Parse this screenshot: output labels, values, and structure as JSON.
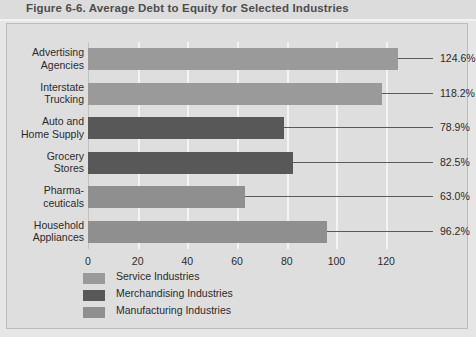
{
  "figure": {
    "title": "Figure 6-6. Average Debt to Equity for Selected Industries"
  },
  "colors": {
    "service": "#9a9a9a",
    "merchandising": "#585858",
    "manufacturing": "#8f8f8f",
    "panel_background": "#dedede",
    "gridline": "#f4f4f4",
    "text": "#2b2b2b",
    "title": "#4d4d4d",
    "leader_line": "#5a5a5a"
  },
  "chart_data": {
    "type": "bar",
    "orientation": "horizontal",
    "title": "Figure 6-6. Average Debt to Equity for Selected Industries",
    "xlabel": "",
    "ylabel": "",
    "xlim": [
      0,
      130
    ],
    "xticks": [
      0,
      20,
      40,
      60,
      80,
      100,
      120
    ],
    "xtick_labels": [
      "0",
      "20",
      "40",
      "60",
      "80",
      "100",
      "120"
    ],
    "grid": "vertical",
    "legend_position": "bottom-left",
    "categories": [
      "Advertising Agencies",
      "Interstate Trucking",
      "Auto and Home Supply",
      "Grocery Stores",
      "Pharmaceuticals",
      "Household Appliances"
    ],
    "category_lines": [
      [
        "Advertising",
        "Agencies"
      ],
      [
        "Interstate",
        "Trucking"
      ],
      [
        "Auto and",
        "Home Supply"
      ],
      [
        "Grocery",
        "Stores"
      ],
      [
        "Pharma-",
        "ceuticals"
      ],
      [
        "Household",
        "Appliances"
      ]
    ],
    "values": [
      124.6,
      118.2,
      78.9,
      82.5,
      63.0,
      96.2
    ],
    "value_labels": [
      "124.6%",
      "118.2%",
      "78.9%",
      "82.5%",
      "63.0%",
      "96.2%"
    ],
    "groups": [
      "Service Industries",
      "Service Industries",
      "Merchandising Industries",
      "Merchandising Industries",
      "Manufacturing Industries",
      "Manufacturing Industries"
    ],
    "series": [
      {
        "name": "Service Industries",
        "color": "#9a9a9a",
        "points": [
          {
            "category": "Advertising Agencies",
            "value": 124.6
          },
          {
            "category": "Interstate Trucking",
            "value": 118.2
          }
        ]
      },
      {
        "name": "Merchandising Industries",
        "color": "#585858",
        "points": [
          {
            "category": "Auto and Home Supply",
            "value": 78.9
          },
          {
            "category": "Grocery Stores",
            "value": 82.5
          }
        ]
      },
      {
        "name": "Manufacturing Industries",
        "color": "#8f8f8f",
        "points": [
          {
            "category": "Pharmaceuticals",
            "value": 63.0
          },
          {
            "category": "Household Appliances",
            "value": 96.2
          }
        ]
      }
    ],
    "legend": [
      {
        "label": "Service Industries",
        "color": "#9a9a9a"
      },
      {
        "label": "Merchandising Industries",
        "color": "#585858"
      },
      {
        "label": "Manufacturing Industries",
        "color": "#8f8f8f"
      }
    ]
  }
}
